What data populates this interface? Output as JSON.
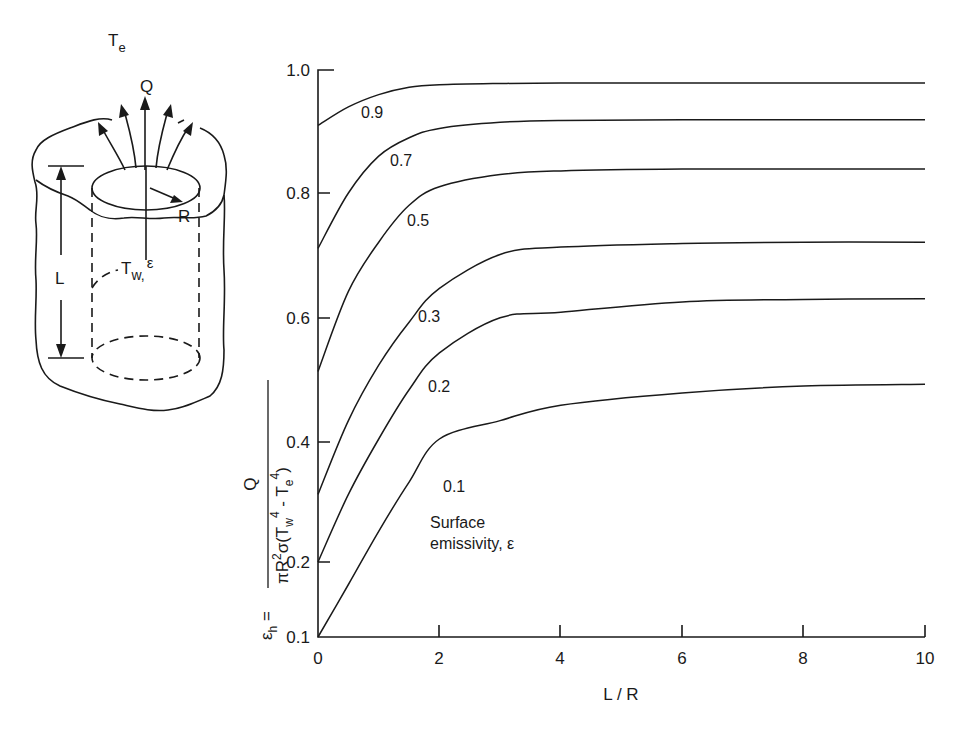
{
  "diagram": {
    "ambient_label": "T",
    "ambient_sub": "e",
    "heat_label": "Q",
    "radius_label": "R",
    "length_label": "L",
    "wall_label": "T",
    "wall_sub": "w,",
    "wall_eps": "ε"
  },
  "annotation": {
    "line1": "Surface",
    "line2": "emissivity, ε"
  },
  "ylabel": {
    "lhs": "ε",
    "lhs_sub": "h",
    "equals": " = ",
    "numerator": "Q",
    "denominator": "πR²σ(T₄⁴ - Tₑ⁴)",
    "den_pi": "πR",
    "den_sq": "2",
    "den_sigma": "σ(T",
    "den_w": "w",
    "den_pow1": "4",
    "den_minus": " - T",
    "den_e": "e",
    "den_pow2": "4",
    "den_close": ")"
  },
  "chart_data": {
    "type": "line",
    "title": "",
    "xlabel": "L / R",
    "ylabel": "εh = Q / (πR²σ(Tw⁴ - Te⁴))",
    "xlim": [
      0,
      10
    ],
    "ylim": [
      0.1,
      1.0
    ],
    "x_ticks": [
      "0",
      "2",
      "4",
      "6",
      "8",
      "10"
    ],
    "y_ticks": [
      "0.1",
      "0.2",
      "0.4",
      "0.6",
      "0.8",
      "1.0"
    ],
    "grid": false,
    "legend": "Surface emissivity, ε (curve labels)",
    "x": [
      0,
      0.5,
      1,
      1.5,
      2,
      3,
      4,
      6,
      8,
      10
    ],
    "series": [
      {
        "name": "0.9",
        "values": [
          0.91,
          0.94,
          0.96,
          0.972,
          0.976,
          0.978,
          0.979,
          0.979,
          0.979,
          0.979
        ]
      },
      {
        "name": "0.7",
        "values": [
          0.71,
          0.8,
          0.86,
          0.89,
          0.905,
          0.915,
          0.918,
          0.919,
          0.919,
          0.919
        ]
      },
      {
        "name": "0.5",
        "values": [
          0.51,
          0.64,
          0.72,
          0.78,
          0.81,
          0.83,
          0.836,
          0.839,
          0.839,
          0.839
        ]
      },
      {
        "name": "0.3",
        "values": [
          0.31,
          0.43,
          0.52,
          0.59,
          0.645,
          0.7,
          0.712,
          0.718,
          0.72,
          0.72
        ]
      },
      {
        "name": "0.2",
        "values": [
          0.2,
          0.31,
          0.4,
          0.48,
          0.54,
          0.597,
          0.606,
          0.623,
          0.627,
          0.628
        ]
      },
      {
        "name": "0.1",
        "values": [
          0.1,
          0.17,
          0.25,
          0.33,
          0.4,
          0.43,
          0.455,
          0.475,
          0.486,
          0.489
        ]
      }
    ]
  }
}
